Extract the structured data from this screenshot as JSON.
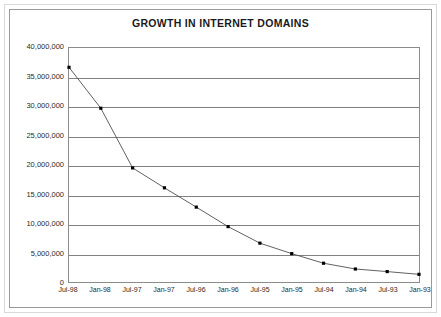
{
  "chart_data": {
    "type": "line",
    "title": "GROWTH IN INTERNET DOMAINS",
    "xlabel": "",
    "ylabel": "",
    "categories": [
      "Jul-98",
      "Jan-98",
      "Jul-97",
      "Jan-97",
      "Jul-96",
      "Jan-96",
      "Jul-95",
      "Jan-95",
      "Jul-94",
      "Jan-94",
      "Jul-93",
      "Jan-93"
    ],
    "values": [
      36700000,
      29700000,
      19500000,
      16100000,
      12800000,
      9470000,
      6640000,
      4850000,
      3210000,
      2220000,
      1780000,
      1310000
    ],
    "series": [
      {
        "name": "Internet Domains",
        "values": [
          36700000,
          29700000,
          19500000,
          16100000,
          12800000,
          9470000,
          6640000,
          4850000,
          3210000,
          2220000,
          1780000,
          1310000
        ]
      }
    ],
    "ylim": [
      0,
      40000000
    ],
    "ytick_values": [
      40000000,
      35000000,
      30000000,
      25000000,
      20000000,
      15000000,
      10000000,
      5000000,
      0
    ],
    "ytick_labels": [
      "40,000,000",
      "35,000,000",
      "30,000,000",
      "25,000,000",
      "20,000,000",
      "15,000,000",
      "10,000,000",
      "5,000,000",
      "0"
    ],
    "grid": true,
    "grid_orientation": "horizontal",
    "legend": false,
    "legend_position": "none",
    "marker": "square",
    "marker_color": "#000000",
    "line_color": "#4d4d4d",
    "plot_background": "#ffffff"
  },
  "colors": {
    "title_text": "#1a1a1a",
    "axis_text": "#2b2b2b",
    "gridline": "#808080",
    "plot_border": "#8c8c8c",
    "outer_border": "#d9d9d9",
    "inner_border": "#9a9a9a"
  }
}
